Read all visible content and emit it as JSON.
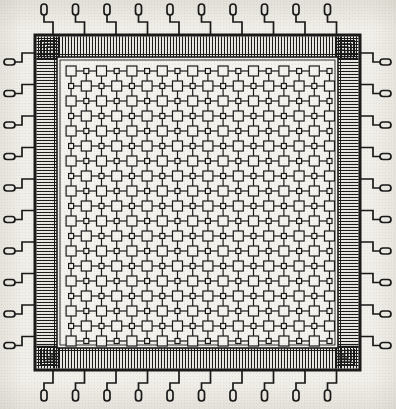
{
  "figure": {
    "title": "Integrated circuit die layout",
    "subtitle": "Packaged chip plan view with peripheral bond pad ring and wire leads",
    "caption": "",
    "domain_note": "monochrome line-art technical drawing on aged paper"
  },
  "colors": {
    "paper": "#f1efe9",
    "ink": "#1a1a1a",
    "ink_soft": "#3a3a3a",
    "die_fill": "#eceae4",
    "core_fill": "#f4f2ed",
    "pad_ring_fill": "#e9e7e1"
  },
  "geometry": {
    "canvas_width": 396,
    "canvas_height": 409,
    "die_left": 35,
    "die_top": 35,
    "die_right": 360,
    "die_bottom": 370,
    "die_border_width": 3,
    "pad_ring_thickness": 22,
    "core_left": 57,
    "core_top": 57,
    "core_right": 338,
    "core_bottom": 348
  },
  "pad_ring": {
    "name": "bond pad ring",
    "teeth_per_side": 96,
    "tooth_pitch_px": 3,
    "tooth_line_width": 1,
    "description": "dense comb of parallel bond finger lines running around all four edges"
  },
  "corners": {
    "style": "nested stepped spiral",
    "turns": 5,
    "description": "concentric right-angle stepped traces at each die corner"
  },
  "leads": {
    "label": "wire bond leads",
    "count_per_side": 10,
    "total": 40,
    "sides": [
      "top",
      "right",
      "bottom",
      "left"
    ],
    "pad_shape": "elongated rounded oval",
    "pad_length": 11,
    "pad_width": 6,
    "stem_shape": "stepped dog-leg",
    "first_offset": 18,
    "pitch": 31.5
  },
  "core_array": {
    "label": "cell array",
    "type": "checkerboard gate / memory array",
    "columns": 19,
    "rows": 20,
    "cell_pitch_x": 15.2,
    "cell_pitch_y": 15.0,
    "large_cell_size": 10,
    "small_cell_size": 5,
    "connector_style": "short horizontal and vertical links",
    "stroke_width": 1.2
  },
  "annotations": []
}
